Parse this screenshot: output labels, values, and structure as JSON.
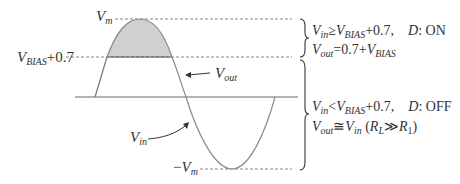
{
  "figure": {
    "labels": {
      "vm_top": {
        "main": "V",
        "sub": "m"
      },
      "vbias_level": {
        "main": "V",
        "sub": "BIAS",
        "suffix": "+0.7"
      },
      "vout": {
        "main": "V",
        "sub": "out"
      },
      "vin": {
        "main": "V",
        "sub": "in"
      },
      "vm_bottom": {
        "prefix": "−",
        "main": "V",
        "sub": "m"
      }
    },
    "conditions": {
      "on": {
        "line1": {
          "v": "V",
          "v_sub": "in",
          "op": "≥",
          "v2": "V",
          "v2_sub": "BIAS",
          "rest": "+0.7,",
          "state_var": "D",
          "state": ": ON"
        },
        "line2": {
          "v": "V",
          "v_sub": "out",
          "rest": "=0.7+",
          "v2": "V",
          "v2_sub": "BIAS"
        }
      },
      "off": {
        "line1": {
          "v": "V",
          "v_sub": "in",
          "op": "<",
          "v2": "V",
          "v2_sub": "BIAS",
          "rest": "+0.7,",
          "state_var": "D",
          "state": ": OFF"
        },
        "line2": {
          "v": "V",
          "v_sub": "out",
          "op": "≅",
          "v2": "V",
          "v2_sub": "in",
          "paren_open": " (",
          "r1": "R",
          "r1_sub": "L",
          "rel": "≫",
          "r2": "R",
          "r2_sub": "1",
          "paren_close": ")"
        }
      }
    },
    "colors": {
      "curve": "#8a8a8a",
      "clipped_fill": "#d0d0d0",
      "lines": "#555555",
      "text": "#333333"
    }
  }
}
